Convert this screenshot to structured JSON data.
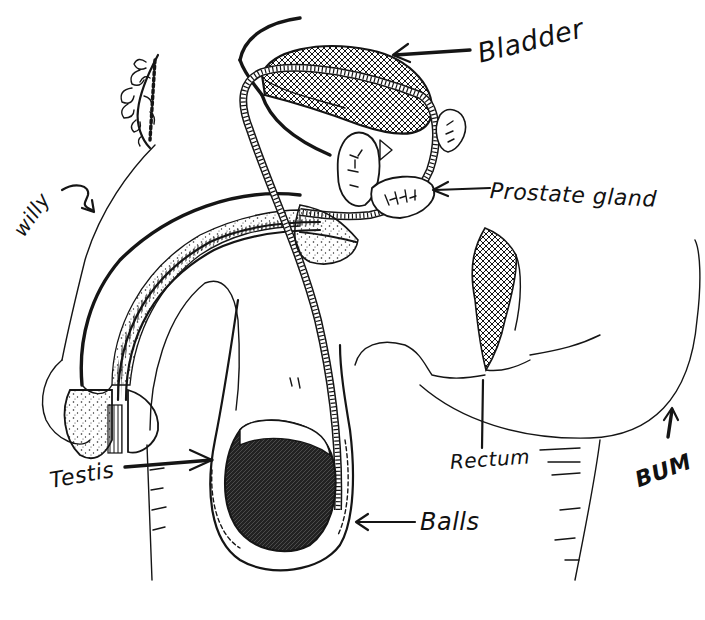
{
  "diagram": {
    "type": "hand-drawn anatomical illustration",
    "colors": {
      "ink": "#151515",
      "background": "#ffffff"
    }
  },
  "labels": {
    "bladder": {
      "text": "Bladder",
      "arrow": "points left to bladder"
    },
    "prostate": {
      "text": "Prostate gland",
      "arrow": "points left to prostate"
    },
    "willy": {
      "text": "willy",
      "arrow": "curved arrow pointing down-right to penis"
    },
    "testis": {
      "text": "Testis",
      "arrow": "points right to testis"
    },
    "rectum": {
      "text": "Rectum",
      "arrow": "line pointing up to rectum"
    },
    "bum": {
      "text": "BUM",
      "arrow": "points up to buttock"
    },
    "balls": {
      "text": "Balls",
      "arrow": "points left to scrotum"
    }
  },
  "structures": [
    "pubic-hair",
    "bladder",
    "vas-deferens",
    "seminal-vesicle",
    "prostate-gland",
    "urethra",
    "penis-shaft",
    "glans",
    "scrotum",
    "testis",
    "rectum",
    "buttock",
    "thigh"
  ]
}
